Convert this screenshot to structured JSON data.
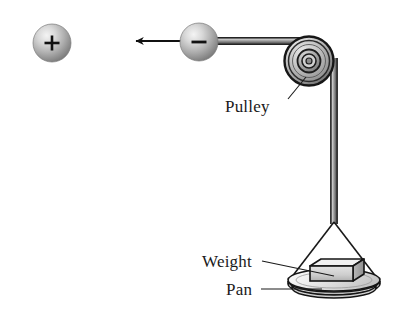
{
  "figure": {
    "background_color": "#ffffff",
    "width": 411,
    "height": 328
  },
  "labels": {
    "pulley": "Pulley",
    "weight": "Weight",
    "pan": "Pan"
  },
  "spheres": [
    {
      "name": "positive-sphere",
      "charge_symbol": "+",
      "center_x": 52,
      "center_y": 43,
      "radius": 19,
      "fill_light": "#e8e8e8",
      "fill_dark": "#8f8f8f"
    },
    {
      "name": "negative-sphere",
      "charge_symbol": "−",
      "center_x": 199,
      "center_y": 42,
      "radius": 19,
      "fill_light": "#e8e8e8",
      "fill_dark": "#8f8f8f"
    }
  ],
  "arrow": {
    "name": "force-arrow",
    "from_x": 180,
    "from_y": 41,
    "to_x": 131,
    "to_y": 41,
    "color": "#111111"
  },
  "rope": {
    "name": "rope",
    "color_edge": "#2b2b2b",
    "color_fill": "#9a9a9a",
    "horizontal_y": 41,
    "horizontal_from_x": 210,
    "horizontal_to_x": 312,
    "vertical_x": 334,
    "vertical_from_y": 60,
    "vertical_to_y": 223
  },
  "pulley": {
    "name": "pulley",
    "center_x": 309,
    "center_y": 61,
    "outer_radius": 24,
    "rim_radius": 21,
    "hub_outer_radius": 12,
    "hub_inner_radius": 7,
    "axle_radius": 3,
    "fill_light": "#e6e6e6",
    "fill_mid": "#b5b5b5",
    "fill_dark": "#6e6e6e",
    "stroke": "#1d1d1d"
  },
  "pan": {
    "name": "pan",
    "center_x": 334,
    "center_y": 282,
    "radius_x": 46,
    "radius_y": 11,
    "depth": 11,
    "fill_light": "#f0f0f0",
    "fill_mid": "#cccccc",
    "stroke": "#1a1a1a"
  },
  "weight": {
    "name": "weight-block",
    "left": 310,
    "top": 261,
    "width": 43,
    "height": 20,
    "depth": 11,
    "face_fill": "#d2d2d2",
    "top_fill": "#efefef",
    "side_fill": "#a6a6a6",
    "stroke": "#1a1a1a"
  },
  "suspension": {
    "name": "suspension-strings",
    "apex_x": 334,
    "apex_y": 223,
    "left_x": 289,
    "left_y": 280,
    "right_x": 379,
    "right_y": 280,
    "color": "#1a1a1a"
  },
  "leaders": [
    {
      "name": "pulley-leader-line",
      "from_x": 289,
      "from_y": 99,
      "to_x": 306,
      "to_y": 77
    },
    {
      "name": "weight-leader-line",
      "from_x": 262,
      "from_y": 261,
      "to_x": 334,
      "to_y": 276
    },
    {
      "name": "pan-leader-line",
      "from_x": 261,
      "from_y": 289,
      "to_x": 321,
      "to_y": 289
    }
  ]
}
